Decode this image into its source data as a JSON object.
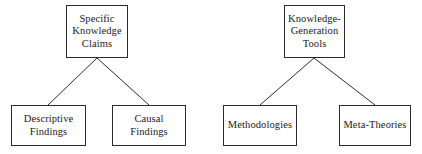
{
  "diagram": {
    "type": "hierarchy-tree-pair",
    "background_color": "#ffffff",
    "line_color": "#2b2b2b",
    "text_color": "#1a1a1a",
    "trees": [
      {
        "id": "specific-knowledge-claims-tree",
        "root": {
          "id": "specific-knowledge-claims",
          "label": "Specific\nKnowledge\nClaims"
        },
        "children": [
          {
            "id": "descriptive-findings",
            "label": "Descriptive\nFindings"
          },
          {
            "id": "causal-findings",
            "label": "Causal\nFindings"
          }
        ]
      },
      {
        "id": "knowledge-generation-tools-tree",
        "root": {
          "id": "knowledge-generation-tools",
          "label": "Knowledge-\nGeneration\nTools"
        },
        "children": [
          {
            "id": "methodologies",
            "label": "Methodologies"
          },
          {
            "id": "meta-theories",
            "label": "Meta-Theories"
          }
        ]
      }
    ],
    "connectors": [
      {
        "id": "left-root-to-descriptive",
        "x1": 97,
        "y1": 58,
        "x2": 48,
        "y2": 105
      },
      {
        "id": "left-root-to-causal",
        "x1": 97,
        "y1": 58,
        "x2": 149,
        "y2": 105
      },
      {
        "id": "right-root-to-methodologies",
        "x1": 314,
        "y1": 58,
        "x2": 260,
        "y2": 105
      },
      {
        "id": "right-root-to-meta-theories",
        "x1": 314,
        "y1": 58,
        "x2": 375,
        "y2": 105
      }
    ]
  }
}
